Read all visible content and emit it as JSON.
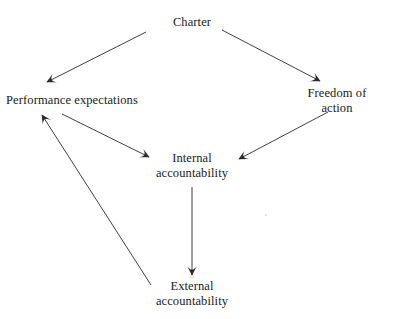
{
  "diagram": {
    "background_color": "#ffffff",
    "line_color": "#2b2b2b",
    "text_color": "#1a1a1a",
    "nodes": [
      {
        "id": "charter",
        "label": "Charter",
        "x": 192,
        "y": 22
      },
      {
        "id": "performance-expectations",
        "label": "Performance expectations",
        "x": 72,
        "y": 100
      },
      {
        "id": "freedom-of-action",
        "label": "Freedom of action",
        "x": 337,
        "y": 100
      },
      {
        "id": "internal-accountability",
        "label": "Internal\naccountability",
        "x": 192,
        "y": 165
      },
      {
        "id": "external-accountability",
        "label": "External\naccountability",
        "x": 192,
        "y": 293
      }
    ],
    "edges": [
      {
        "id": "charter-to-performance",
        "from": "charter",
        "to": "performance-expectations",
        "x1": 146,
        "y1": 32,
        "x2": 47,
        "y2": 82,
        "arrow": "end"
      },
      {
        "id": "charter-to-freedom",
        "from": "charter",
        "to": "freedom-of-action",
        "x1": 222,
        "y1": 30,
        "x2": 320,
        "y2": 81,
        "arrow": "end"
      },
      {
        "id": "performance-to-internal",
        "from": "performance-expectations",
        "to": "internal-accountability",
        "x1": 62,
        "y1": 114,
        "x2": 149,
        "y2": 157,
        "arrow": "end"
      },
      {
        "id": "freedom-to-internal",
        "from": "freedom-of-action",
        "to": "internal-accountability",
        "x1": 328,
        "y1": 112,
        "x2": 239,
        "y2": 159,
        "arrow": "end"
      },
      {
        "id": "internal-to-external",
        "from": "internal-accountability",
        "to": "external-accountability",
        "x1": 192,
        "y1": 187,
        "x2": 192,
        "y2": 275,
        "arrow": "end"
      },
      {
        "id": "external-to-performance",
        "from": "external-accountability",
        "to": "performance-expectations",
        "x1": 151,
        "y1": 285,
        "x2": 42,
        "y2": 115,
        "arrow": "end"
      }
    ],
    "specks": [
      {
        "id": "speck-right",
        "x": 265,
        "y": 214,
        "size": 2
      }
    ]
  }
}
